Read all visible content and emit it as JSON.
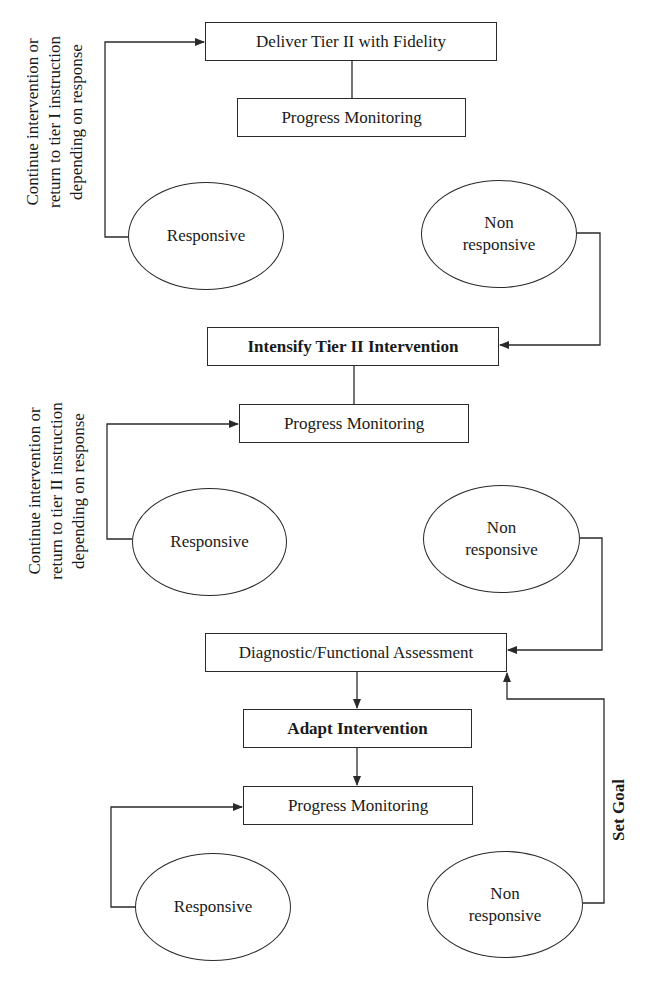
{
  "diagram": {
    "type": "flowchart",
    "section1": {
      "deliver_box": "Deliver Tier II  with Fidelity",
      "progress_box": "Progress Monitoring",
      "responsive_oval": "Responsive",
      "nonresponsive_oval": [
        "Non",
        "responsive"
      ],
      "side_note": [
        "Continue intervention or",
        "return to tier I instruction",
        "depending on response"
      ]
    },
    "section2": {
      "intensify_box": "Intensify Tier II Intervention",
      "progress_box": "Progress Monitoring",
      "responsive_oval": "Responsive",
      "nonresponsive_oval": [
        "Non",
        "responsive"
      ],
      "side_note": [
        "Continue intervention or",
        "return to tier II instruction",
        "depending on response"
      ]
    },
    "section3": {
      "diagnostic_box": "Diagnostic/Functional Assessment",
      "adapt_box": "Adapt Intervention",
      "progress_box": "Progress Monitoring",
      "responsive_oval": "Responsive",
      "nonresponsive_oval": [
        "Non",
        "responsive"
      ],
      "goal_label": "Set Goal"
    },
    "colors": {
      "line": "#2a2a2a",
      "background": "#ffffff",
      "text": "#1a1a1a"
    }
  }
}
